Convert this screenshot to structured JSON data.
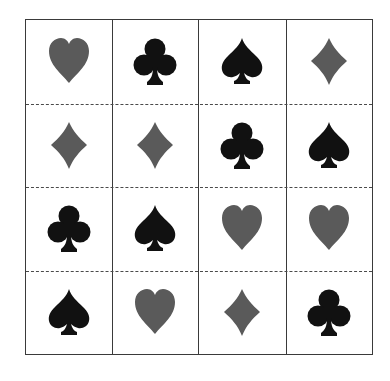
{
  "colors": {
    "red_suit": "#5a5a5a",
    "black_suit": "#111111",
    "grid_line": "#3a3a3a"
  },
  "grid": {
    "rows": 4,
    "cols": 4,
    "cells": [
      [
        "heart",
        "club",
        "spade",
        "diamond"
      ],
      [
        "diamond",
        "diamond",
        "club",
        "spade"
      ],
      [
        "club",
        "spade",
        "heart",
        "heart"
      ],
      [
        "spade",
        "heart",
        "diamond",
        "club"
      ]
    ]
  }
}
